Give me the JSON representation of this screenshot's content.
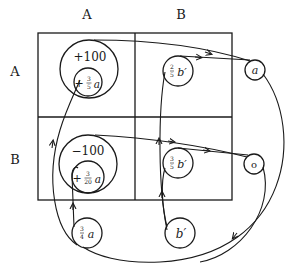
{
  "column_headers": [
    "A",
    "B"
  ],
  "row_headers": [
    "A",
    "B"
  ],
  "cells": {
    "AA": {
      "outer": "+100",
      "inner_sign": "+",
      "inner_num": "3",
      "inner_den": "5",
      "inner_var": "a"
    },
    "BA": {
      "outer": "−100",
      "inner_sign": "+",
      "inner_num": "3",
      "inner_den": "20",
      "inner_var": "a"
    },
    "AB": {
      "num": "2",
      "den": "5",
      "var": "b′"
    },
    "BB": {
      "num": "3",
      "den": "5",
      "var": "b′"
    }
  },
  "outside_nodes": {
    "a_node": "a",
    "o_node": "o",
    "three_quarter_a": {
      "num": "3",
      "den": "4",
      "var": "a"
    },
    "b_prime": "b′"
  },
  "colors": {
    "ink": "#1a1a1a",
    "background": "#ffffff"
  }
}
